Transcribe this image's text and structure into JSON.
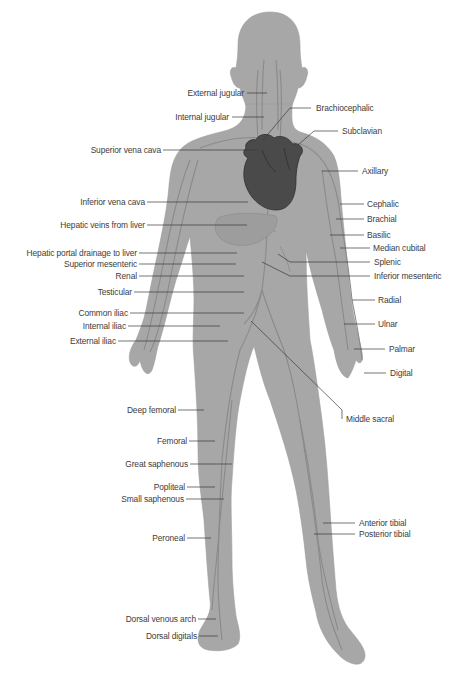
{
  "diagram": {
    "colors": {
      "background": "#ffffff",
      "body": "#a7a7a7",
      "body_edge": "#9a9a9a",
      "vein": "#8c8c8c",
      "heart": "#4a4a4a",
      "heart_edge": "#2e2e2e",
      "leader_line": "#3a3a3a",
      "label_text": "#3c3c3c"
    },
    "labels_left": [
      {
        "id": "external-jugular",
        "text": "External jugular",
        "x": 247,
        "y": 93,
        "tx": 267,
        "ty": 93
      },
      {
        "id": "internal-jugular",
        "text": "Internal jugular",
        "x": 232,
        "y": 117,
        "tx": 264,
        "ty": 117
      },
      {
        "id": "superior-vena-cava",
        "text": "Superior vena cava",
        "x": 163,
        "y": 150,
        "tx": 258,
        "ty": 150
      },
      {
        "id": "inferior-vena-cava",
        "text": "Inferior vena cava",
        "x": 147,
        "y": 202,
        "tx": 248,
        "ty": 202
      },
      {
        "id": "hepatic-veins-from-liver",
        "text": "Hepatic veins from liver",
        "x": 147,
        "y": 225,
        "tx": 247,
        "ty": 225
      },
      {
        "id": "hepatic-portal-drainage",
        "text": "Hepatic portal drainage to liver",
        "x": 139,
        "y": 253,
        "tx": 237,
        "ty": 253
      },
      {
        "id": "superior-mesenteric",
        "text": "Superior mesenteric",
        "x": 139,
        "y": 264,
        "tx": 236,
        "ty": 264
      },
      {
        "id": "renal",
        "text": "Renal",
        "x": 139,
        "y": 276,
        "tx": 244,
        "ty": 276
      },
      {
        "id": "testicular",
        "text": "Testicular",
        "x": 134,
        "y": 292,
        "tx": 244,
        "ty": 292
      },
      {
        "id": "common-iliac",
        "text": "Common iliac",
        "x": 130,
        "y": 313,
        "tx": 244,
        "ty": 313
      },
      {
        "id": "internal-iliac",
        "text": "Internal iliac",
        "x": 128,
        "y": 326,
        "tx": 220,
        "ty": 326
      },
      {
        "id": "external-iliac",
        "text": "External iliac",
        "x": 118,
        "y": 341,
        "tx": 228,
        "ty": 341
      },
      {
        "id": "deep-femoral",
        "text": "Deep femoral",
        "x": 178,
        "y": 410,
        "tx": 204,
        "ty": 410
      },
      {
        "id": "femoral",
        "text": "Femoral",
        "x": 189,
        "y": 441,
        "tx": 215,
        "ty": 441
      },
      {
        "id": "great-saphenous",
        "text": "Great saphenous",
        "x": 190,
        "y": 464,
        "tx": 232,
        "ty": 464
      },
      {
        "id": "popliteal",
        "text": "Popliteal",
        "x": 187,
        "y": 487,
        "tx": 215,
        "ty": 487
      },
      {
        "id": "small-saphenous",
        "text": "Small saphenous",
        "x": 186,
        "y": 499,
        "tx": 224,
        "ty": 499
      },
      {
        "id": "peroneal",
        "text": "Peroneal",
        "x": 187,
        "y": 538,
        "tx": 211,
        "ty": 538
      },
      {
        "id": "dorsal-venous-arch",
        "text": "Dorsal venous arch",
        "x": 198,
        "y": 619,
        "tx": 216,
        "ty": 619
      },
      {
        "id": "dorsal-digitals",
        "text": "Dorsal digitals",
        "x": 199,
        "y": 636,
        "tx": 218,
        "ty": 636
      }
    ],
    "labels_right": [
      {
        "id": "brachiocephalic",
        "text": "Brachiocephalic",
        "x": 314,
        "y": 108,
        "tx": 290,
        "ty": 108,
        "bx": 263,
        "by": 140
      },
      {
        "id": "subclavian",
        "text": "Subclavian",
        "x": 341,
        "y": 131,
        "tx": 314,
        "ty": 131,
        "bx": 298,
        "by": 145
      },
      {
        "id": "axillary",
        "text": "Axillary",
        "x": 361,
        "y": 171,
        "tx": 322,
        "ty": 171
      },
      {
        "id": "cephalic",
        "text": "Cephalic",
        "x": 367,
        "y": 204,
        "tx": 340,
        "ty": 204
      },
      {
        "id": "brachial",
        "text": "Brachial",
        "x": 367,
        "y": 219,
        "tx": 336,
        "ty": 219
      },
      {
        "id": "basilic",
        "text": "Basilic",
        "x": 367,
        "y": 235,
        "tx": 330,
        "ty": 235
      },
      {
        "id": "median-cubital",
        "text": "Median cubital",
        "x": 373,
        "y": 248,
        "tx": 340,
        "ty": 248
      },
      {
        "id": "splenic",
        "text": "Splenic",
        "x": 373,
        "y": 262,
        "tx": 290,
        "ty": 262,
        "bx": 278,
        "by": 254
      },
      {
        "id": "inferior-mesenteric",
        "text": "Inferior mesenteric",
        "x": 373,
        "y": 276,
        "tx": 290,
        "ty": 276,
        "bx": 262,
        "by": 262
      },
      {
        "id": "radial",
        "text": "Radial",
        "x": 378,
        "y": 300,
        "tx": 352,
        "ty": 300
      },
      {
        "id": "ulnar",
        "text": "Ulnar",
        "x": 378,
        "y": 324,
        "tx": 344,
        "ty": 324
      },
      {
        "id": "palmar",
        "text": "Palmar",
        "x": 388,
        "y": 349,
        "tx": 354,
        "ty": 349
      },
      {
        "id": "digital",
        "text": "Digital",
        "x": 389,
        "y": 373,
        "tx": 364,
        "ty": 373
      },
      {
        "id": "middle-sacral",
        "text": "Middle sacral",
        "x": 345,
        "y": 419,
        "tx": 342,
        "ty": 410,
        "bx": 251,
        "by": 321
      },
      {
        "id": "anterior-tibial",
        "text": "Anterior tibial",
        "x": 358,
        "y": 523,
        "tx": 323,
        "ty": 523
      },
      {
        "id": "posterior-tibial",
        "text": "Posterior tibial",
        "x": 358,
        "y": 534,
        "tx": 314,
        "ty": 534
      }
    ]
  }
}
